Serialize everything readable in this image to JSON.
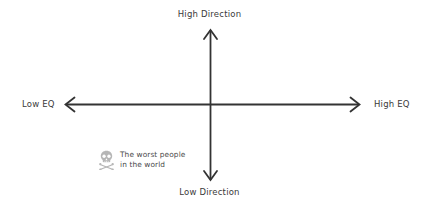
{
  "diagram": {
    "type": "quadrant-axes",
    "background_color": "#ffffff",
    "axis_color": "#333333",
    "text_color": "#3a3a3a",
    "annotation_color": "#4a4a4a",
    "axes": {
      "vertical": {
        "top_label": "High Direction",
        "bottom_label": "Low Direction",
        "arrowheads": "both"
      },
      "horizontal": {
        "left_label": "Low EQ",
        "right_label": "High EQ",
        "arrowheads": "both"
      }
    },
    "annotations": [
      {
        "icon": "skull-and-crossbones-icon",
        "text": "The worst people\nin the world",
        "quadrant": "bottom-left"
      }
    ]
  }
}
